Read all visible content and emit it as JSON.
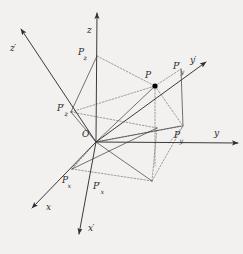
{
  "figure": {
    "kind": "diagram",
    "background_color": "#f2f1ef",
    "line_color": "#3a3a3a",
    "dashed_color": "#6e6e6e",
    "label_color": "#2b2b2b",
    "point_color": "#000000",
    "width": 243,
    "height": 254
  },
  "origin": {
    "label": "O",
    "x": 96,
    "y": 142
  },
  "point": {
    "label": "P",
    "x": 155,
    "y": 86,
    "radius": 2.6
  },
  "axes": [
    {
      "name": "z-axis",
      "label": "z",
      "primed": false,
      "start_x": 96,
      "start_y": 142,
      "end_x": 97,
      "end_y": 13,
      "label_x": 87,
      "label_y": 26
    },
    {
      "name": "y-axis",
      "label": "y",
      "primed": false,
      "start_x": 96,
      "start_y": 142,
      "end_x": 238,
      "end_y": 143,
      "label_x": 214,
      "label_y": 129
    },
    {
      "name": "x-axis",
      "label": "x",
      "primed": false,
      "start_x": 96,
      "start_y": 142,
      "end_x": 32,
      "end_y": 208,
      "label_x": 46,
      "label_y": 203
    },
    {
      "name": "z-prime-axis",
      "label": "z",
      "primed": true,
      "start_x": 96,
      "start_y": 142,
      "end_x": 21,
      "end_y": 29,
      "label_x": 10,
      "label_y": 44
    },
    {
      "name": "y-prime-axis",
      "label": "y",
      "primed": true,
      "start_x": 96,
      "start_y": 142,
      "end_x": 206,
      "end_y": 62,
      "label_x": 190,
      "label_y": 56
    },
    {
      "name": "x-prime-axis",
      "label": "x",
      "primed": true,
      "start_x": 96,
      "start_y": 142,
      "end_x": 79,
      "end_y": 234,
      "label_x": 88,
      "label_y": 224
    }
  ],
  "projection_labels": [
    {
      "name": "pz",
      "base": "P",
      "sub": "z",
      "primed": false,
      "x": 78,
      "y": 48
    },
    {
      "name": "pz-prime",
      "base": "P",
      "sub": "z",
      "primed": true,
      "x": 57,
      "y": 104
    },
    {
      "name": "py",
      "base": "P",
      "sub": "y",
      "primed": false,
      "x": 174,
      "y": 131
    },
    {
      "name": "py-prime",
      "base": "P",
      "sub": "y",
      "primed": true,
      "x": 173,
      "y": 62
    },
    {
      "name": "px",
      "base": "P",
      "sub": "x",
      "primed": false,
      "x": 62,
      "y": 176
    },
    {
      "name": "px-prime",
      "base": "P",
      "sub": "x",
      "primed": true,
      "x": 93,
      "y": 182
    }
  ],
  "solid_segments": [
    {
      "name": "p-to-origin-ray",
      "x1": 96,
      "y1": 142,
      "x2": 155,
      "y2": 86
    },
    {
      "name": "pz-to-pzprime",
      "x1": 97,
      "y1": 56,
      "x2": 71,
      "y2": 112
    },
    {
      "name": "pzprime-to-origin",
      "x1": 71,
      "y1": 112,
      "x2": 96,
      "y2": 142
    },
    {
      "name": "origin-to-lower-a",
      "x1": 96,
      "y1": 142,
      "x2": 152,
      "y2": 181
    },
    {
      "name": "origin-to-lower-b",
      "x1": 96,
      "y1": 142,
      "x2": 181,
      "y2": 126
    },
    {
      "name": "px-diag",
      "x1": 72,
      "y1": 169,
      "x2": 157,
      "y2": 128
    },
    {
      "name": "pyprime-drop",
      "x1": 181,
      "y1": 69,
      "x2": 183,
      "y2": 126
    }
  ],
  "dashed_segments": [
    {
      "name": "pz-to-p",
      "x1": 97,
      "y1": 56,
      "x2": 155,
      "y2": 86
    },
    {
      "name": "p-vertical-drop",
      "x1": 155,
      "y1": 86,
      "x2": 155,
      "y2": 166
    },
    {
      "name": "pzprime-to-p",
      "x1": 71,
      "y1": 112,
      "x2": 155,
      "y2": 86
    },
    {
      "name": "p-to-pyprime",
      "x1": 155,
      "y1": 86,
      "x2": 181,
      "y2": 69
    },
    {
      "name": "p-box-right",
      "x1": 155,
      "y1": 86,
      "x2": 183,
      "y2": 126
    },
    {
      "name": "p-box-lower",
      "x1": 152,
      "y1": 181,
      "x2": 183,
      "y2": 126
    },
    {
      "name": "lower-box-top",
      "x1": 96,
      "y1": 142,
      "x2": 183,
      "y2": 126
    },
    {
      "name": "lower-box-left",
      "x1": 72,
      "y1": 169,
      "x2": 96,
      "y2": 142
    },
    {
      "name": "lower-box-bottom",
      "x1": 72,
      "y1": 169,
      "x2": 152,
      "y2": 181
    },
    {
      "name": "lower-box-right",
      "x1": 152,
      "y1": 181,
      "x2": 157,
      "y2": 128
    },
    {
      "name": "py-connector",
      "x1": 169,
      "y1": 143,
      "x2": 183,
      "y2": 126
    },
    {
      "name": "upper-left-connect",
      "x1": 71,
      "y1": 112,
      "x2": 157,
      "y2": 128
    },
    {
      "name": "px-tick",
      "x1": 72,
      "y1": 169,
      "x2": 77,
      "y2": 163
    }
  ]
}
